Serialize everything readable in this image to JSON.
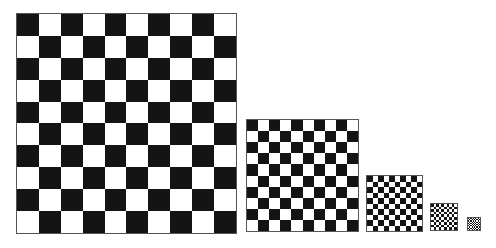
{
  "scene": {
    "description": "Five checkerboards of decreasing size aligned along a common bottom edge",
    "colors": {
      "dark": "#141414",
      "light": "#ffffff",
      "border": "#555555"
    }
  },
  "boards": [
    {
      "name": "checkerboard-large",
      "rows": 10,
      "cols": 10,
      "x": 16,
      "y": 13,
      "size": 221,
      "first_cell": "dark"
    },
    {
      "name": "checkerboard-medium",
      "rows": 10,
      "cols": 10,
      "x": 246,
      "y": 119,
      "size": 113,
      "first_cell": "dark"
    },
    {
      "name": "checkerboard-small",
      "rows": 10,
      "cols": 10,
      "x": 366,
      "y": 175,
      "size": 57,
      "first_cell": "dark"
    },
    {
      "name": "checkerboard-tiny",
      "rows": 10,
      "cols": 10,
      "x": 430,
      "y": 203,
      "size": 28,
      "first_cell": "dark"
    },
    {
      "name": "checkerboard-minimal",
      "rows": 10,
      "cols": 10,
      "x": 467,
      "y": 217,
      "size": 14,
      "first_cell": "dark"
    }
  ]
}
